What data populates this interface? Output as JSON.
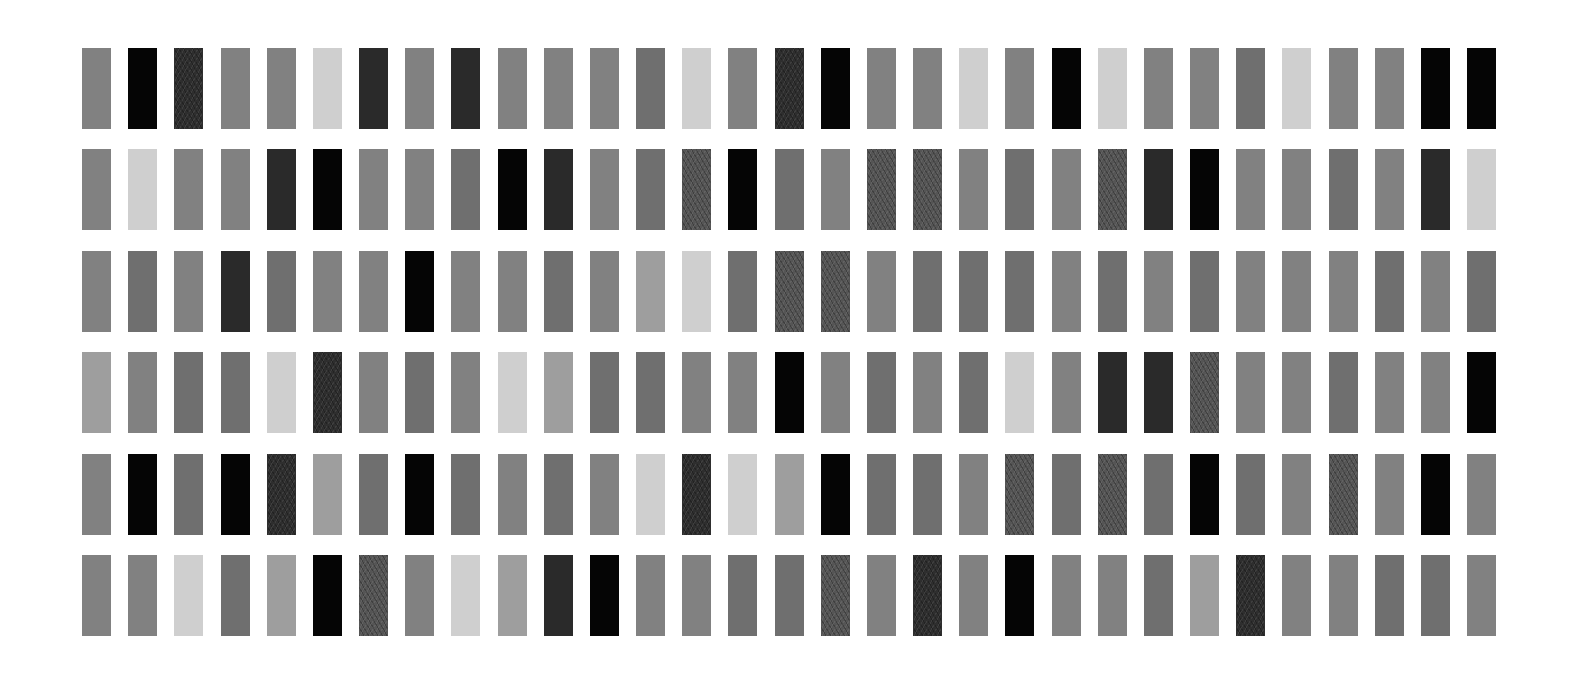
{
  "grid": {
    "rows": 6,
    "cols": 31,
    "origin_x": 82,
    "origin_y": 48,
    "pitch_x": 46.17,
    "pitch_y": 101.4,
    "tile_width": 29,
    "tile_height": 81,
    "background": "#ffffff"
  },
  "palette": {
    "K": "#050505",
    "D": "#2a2a2a",
    "T": "#2e2e2e",
    "S": "#555555",
    "M": "#6f6f6f",
    "G": "#818181",
    "L": "#9e9e9e",
    "W": "#cfcfcf"
  },
  "textured": [
    "T",
    "S"
  ],
  "tiles": [
    [
      "G",
      "K",
      "T",
      "G",
      "G",
      "W",
      "D",
      "G",
      "D",
      "G",
      "G",
      "G",
      "M",
      "W",
      "G",
      "T",
      "K",
      "G",
      "G",
      "W",
      "G",
      "K",
      "W",
      "G",
      "G",
      "M",
      "W",
      "G",
      "G",
      "K",
      "K"
    ],
    [
      "G",
      "W",
      "G",
      "G",
      "D",
      "K",
      "G",
      "G",
      "M",
      "K",
      "D",
      "G",
      "M",
      "S",
      "K",
      "M",
      "G",
      "S",
      "S",
      "G",
      "M",
      "G",
      "S",
      "D",
      "K",
      "G",
      "G",
      "M",
      "G",
      "D",
      "W"
    ],
    [
      "G",
      "M",
      "G",
      "D",
      "M",
      "G",
      "G",
      "K",
      "G",
      "G",
      "M",
      "G",
      "L",
      "W",
      "M",
      "S",
      "S",
      "G",
      "M",
      "M",
      "M",
      "G",
      "M",
      "G",
      "M",
      "G",
      "G",
      "G",
      "M",
      "G",
      "M"
    ],
    [
      "L",
      "G",
      "M",
      "M",
      "W",
      "T",
      "G",
      "M",
      "G",
      "W",
      "L",
      "M",
      "M",
      "G",
      "G",
      "K",
      "G",
      "M",
      "G",
      "M",
      "W",
      "G",
      "D",
      "D",
      "S",
      "G",
      "G",
      "M",
      "G",
      "G",
      "K"
    ],
    [
      "G",
      "K",
      "M",
      "K",
      "T",
      "L",
      "M",
      "K",
      "M",
      "G",
      "M",
      "G",
      "W",
      "T",
      "W",
      "L",
      "K",
      "M",
      "M",
      "G",
      "S",
      "M",
      "S",
      "M",
      "K",
      "M",
      "G",
      "S",
      "G",
      "K",
      "G"
    ],
    [
      "G",
      "G",
      "W",
      "M",
      "L",
      "K",
      "S",
      "G",
      "W",
      "L",
      "D",
      "K",
      "G",
      "G",
      "M",
      "M",
      "S",
      "G",
      "T",
      "G",
      "K",
      "G",
      "G",
      "M",
      "L",
      "T",
      "G",
      "G",
      "M",
      "M",
      "G"
    ]
  ]
}
